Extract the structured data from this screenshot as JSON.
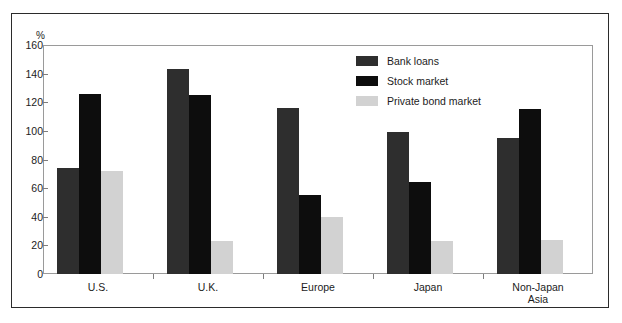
{
  "chart_data": {
    "type": "bar",
    "title": "",
    "subtitle": "",
    "xlabel": "",
    "ylabel": "%",
    "ylim": [
      0,
      160
    ],
    "y_ticks": [
      0,
      20,
      40,
      60,
      80,
      100,
      120,
      140,
      160
    ],
    "y_tick_labels": [
      "0",
      "20",
      "40",
      "60",
      "80",
      "100",
      "120",
      "140",
      "160"
    ],
    "grid": false,
    "legend_position": "top-right-inside",
    "categories": [
      "U.S.",
      "U.K.",
      "Europe",
      "Japan",
      "Non-Japan\nAsia"
    ],
    "series": [
      {
        "name": "Bank loans",
        "color": "#2e2e2e",
        "values": [
          74,
          143,
          116,
          99,
          95
        ]
      },
      {
        "name": "Stock market",
        "color": "#0d0d0d",
        "values": [
          126,
          125,
          55,
          64,
          115
        ]
      },
      {
        "name": "Private bond market",
        "color": "#d2d2d2",
        "values": [
          72,
          23,
          40,
          23,
          24
        ]
      }
    ]
  },
  "colors": {
    "bank_loans": "#2e2e2e",
    "stock_market": "#0d0d0d",
    "private_bond_market": "#d2d2d2",
    "axis": "#9a9a9a",
    "frame": "#2b2b2b",
    "text": "#1c1c1c"
  }
}
